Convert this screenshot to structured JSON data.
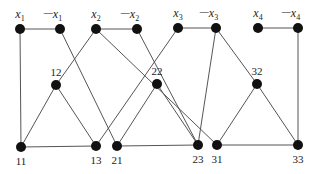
{
  "diagram": {
    "title": "",
    "node_color": "#111111",
    "edge_color": "#555555",
    "variable_nodes": [
      {
        "id": "x1",
        "label_var": "x",
        "label_sub": "1",
        "negated": false,
        "x": 20,
        "y": 29
      },
      {
        "id": "nx1",
        "label_var": "x",
        "label_sub": "1",
        "negated": true,
        "x": 60,
        "y": 29
      },
      {
        "id": "x2",
        "label_var": "x",
        "label_sub": "2",
        "negated": false,
        "x": 96,
        "y": 29
      },
      {
        "id": "nx2",
        "label_var": "x",
        "label_sub": "2",
        "negated": true,
        "x": 137,
        "y": 29
      },
      {
        "id": "x3",
        "label_var": "x",
        "label_sub": "3",
        "negated": false,
        "x": 178,
        "y": 28
      },
      {
        "id": "nx3",
        "label_var": "x",
        "label_sub": "3",
        "negated": true,
        "x": 216,
        "y": 28
      },
      {
        "id": "x4",
        "label_var": "x",
        "label_sub": "4",
        "negated": false,
        "x": 258,
        "y": 28
      },
      {
        "id": "nx4",
        "label_var": "x",
        "label_sub": "4",
        "negated": true,
        "x": 298,
        "y": 28
      }
    ],
    "clause_nodes": [
      {
        "id": "12",
        "label": "12",
        "x": 56,
        "y": 85
      },
      {
        "id": "22",
        "label": "22",
        "x": 157,
        "y": 84
      },
      {
        "id": "32",
        "label": "32",
        "x": 257,
        "y": 84
      },
      {
        "id": "11",
        "label": "11",
        "x": 21,
        "y": 147
      },
      {
        "id": "13",
        "label": "13",
        "x": 96,
        "y": 146
      },
      {
        "id": "21",
        "label": "21",
        "x": 117,
        "y": 146
      },
      {
        "id": "23",
        "label": "23",
        "x": 198,
        "y": 145
      },
      {
        "id": "31",
        "label": "31",
        "x": 217,
        "y": 145
      },
      {
        "id": "33",
        "label": "33",
        "x": 298,
        "y": 145
      }
    ],
    "negation_prefix": "—",
    "edges": [
      [
        "x1",
        "nx1"
      ],
      [
        "x2",
        "nx2"
      ],
      [
        "x3",
        "nx3"
      ],
      [
        "x4",
        "nx4"
      ],
      [
        "x1",
        "11"
      ],
      [
        "nx1",
        "21"
      ],
      [
        "x2",
        "12"
      ],
      [
        "x2",
        "31"
      ],
      [
        "nx2",
        "23"
      ],
      [
        "x3",
        "13"
      ],
      [
        "nx3",
        "23"
      ],
      [
        "nx3",
        "32"
      ],
      [
        "nx4",
        "33"
      ],
      [
        "12",
        "11"
      ],
      [
        "12",
        "13"
      ],
      [
        "22",
        "21"
      ],
      [
        "22",
        "23"
      ],
      [
        "32",
        "31"
      ],
      [
        "32",
        "33"
      ],
      [
        "11",
        "13"
      ],
      [
        "21",
        "23"
      ],
      [
        "31",
        "33"
      ]
    ]
  }
}
